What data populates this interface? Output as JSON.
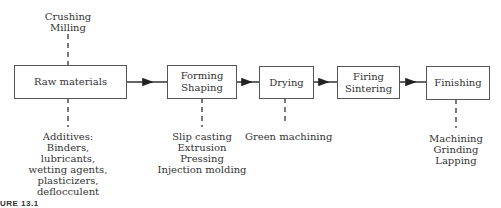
{
  "diagram": {
    "type": "process-flowchart",
    "steps": [
      {
        "id": "raw",
        "lines": [
          "Raw materials"
        ]
      },
      {
        "id": "forming",
        "lines": [
          "Forming",
          "Shaping"
        ]
      },
      {
        "id": "drying",
        "lines": [
          "Drying"
        ]
      },
      {
        "id": "firing",
        "lines": [
          "Firing",
          "Sintering"
        ]
      },
      {
        "id": "finishing",
        "lines": [
          "Finishing"
        ]
      }
    ],
    "annotations": {
      "raw_top": [
        "Crushing",
        "Milling"
      ],
      "raw_bottom": [
        "Additives:",
        "Binders,",
        "lubricants,",
        "wetting agents,",
        "plasticizers,",
        "deflocculent"
      ],
      "forming_bottom": [
        "Slip casting",
        "Extrusion",
        "Pressing",
        "Injection molding"
      ],
      "drying_bottom": [
        "Green machining"
      ],
      "finishing_bottom": [
        "Machining",
        "Grinding",
        "Lapping"
      ]
    },
    "caption": "URE 13.1",
    "colors": {
      "line": "#333333",
      "box_border": "#555555",
      "text": "#333333"
    }
  }
}
